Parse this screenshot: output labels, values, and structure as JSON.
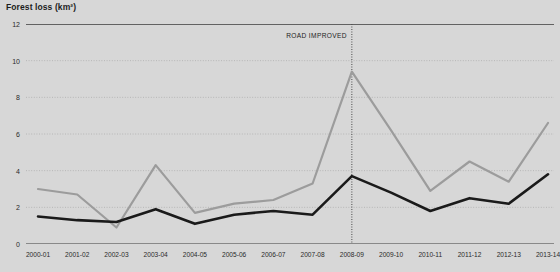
{
  "chart_data": {
    "type": "line",
    "title": "Forest loss (km²)",
    "xlabel": "",
    "ylabel": "Forest loss (km²)",
    "categories": [
      "2000-01",
      "2001-02",
      "2002-03",
      "2003-04",
      "2004-05",
      "2005-06",
      "2006-07",
      "2007-08",
      "2008-09",
      "2009-10",
      "2010-11",
      "2011-12",
      "2012-13",
      "2013-14"
    ],
    "series": [
      {
        "name": "grey-line",
        "color": "#9c9c9c",
        "values": [
          3.0,
          2.7,
          0.9,
          4.3,
          1.7,
          2.2,
          2.4,
          3.3,
          9.4,
          6.2,
          2.9,
          4.5,
          3.4,
          6.6
        ]
      },
      {
        "name": "black-line",
        "color": "#1a1a1a",
        "values": [
          1.5,
          1.3,
          1.2,
          1.9,
          1.1,
          1.6,
          1.8,
          1.6,
          3.7,
          2.8,
          1.8,
          2.5,
          2.2,
          3.8
        ]
      }
    ],
    "ylim": [
      0,
      12
    ],
    "yticks": [
      0,
      2,
      4,
      6,
      8,
      10,
      12
    ],
    "ytick_labels": [
      "0",
      "2",
      "4",
      "6",
      "8",
      "10",
      "12"
    ],
    "grid": true,
    "grid_style": "dotted-horizontal",
    "legend": null,
    "annotations": [
      {
        "text": "ROAD IMPROVED",
        "at_category": "2008-09",
        "marker": "vertical-dotted-line"
      }
    ],
    "colors": {
      "background": "#d7d7d7",
      "grey_series": "#9c9c9c",
      "black_series": "#1a1a1a",
      "axis": "#3b3b3b",
      "grid": "#b6b6b6",
      "text": "#2a2a2a"
    }
  }
}
